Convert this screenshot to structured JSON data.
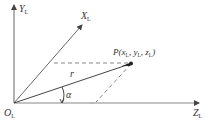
{
  "diagram": {
    "title": "",
    "colors": {
      "axis": "#555555",
      "vector": "#444444",
      "dashed": "#888888",
      "point": "#222222",
      "label": "#333333"
    },
    "labels": {
      "y_axis": "Y",
      "y_axis_sub": "L",
      "x_axis": "X",
      "x_axis_sub": "L",
      "z_axis": "Z",
      "z_axis_sub": "L",
      "origin": "O",
      "origin_sub": "L",
      "point_prefix": "P(x",
      "point_sub1": "L",
      "point_mid1": ", y",
      "point_sub2": "L",
      "point_mid2": ", z",
      "point_sub3": "L",
      "point_suffix": ")",
      "vector": "r",
      "angle": "α"
    },
    "geometry": {
      "origin": [
        14,
        103
      ],
      "y_axis_end": [
        14,
        4
      ],
      "x_axis_end": [
        83,
        24
      ],
      "z_axis_end": [
        199,
        103
      ],
      "point_P": [
        132,
        63
      ],
      "projection_foot": [
        96,
        103
      ],
      "horizontal_dash_start": [
        54,
        63
      ]
    }
  }
}
